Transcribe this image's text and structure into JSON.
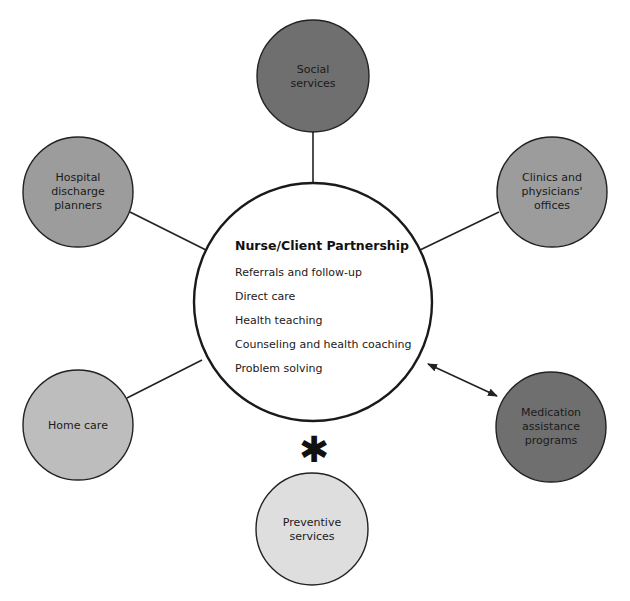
{
  "diagram": {
    "type": "hub-and-spoke",
    "center": {
      "title": "Nurse/Client Partnership",
      "items": [
        "Referrals and follow-up",
        "Direct care",
        "Health teaching",
        "Counseling and health coaching",
        "Problem solving"
      ]
    },
    "nodes": [
      {
        "id": "social-services",
        "lines": [
          "Social",
          "services"
        ],
        "fill": "#6f6f6f",
        "connection": "line"
      },
      {
        "id": "hospital-discharge-planners",
        "lines": [
          "Hospital",
          "discharge",
          "planners"
        ],
        "fill": "#9c9c9c",
        "connection": "line"
      },
      {
        "id": "clinics-physicians-offices",
        "lines": [
          "Clinics and",
          "physicians'",
          "offices"
        ],
        "fill": "#9c9c9c",
        "connection": "line"
      },
      {
        "id": "home-care",
        "lines": [
          "Home care"
        ],
        "fill": "#bdbdbd",
        "connection": "line"
      },
      {
        "id": "medication-assistance-programs",
        "lines": [
          "Medication",
          "assistance",
          "programs"
        ],
        "fill": "#6f6f6f",
        "connection": "double-arrow"
      },
      {
        "id": "preventive-services",
        "lines": [
          "Preventive",
          "services"
        ],
        "fill": "#dedede",
        "connection": "asterisk"
      }
    ],
    "asterisk_symbol": "✱"
  }
}
